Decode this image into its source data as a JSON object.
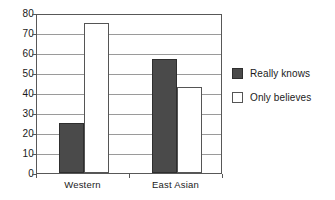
{
  "chart_data": {
    "type": "bar",
    "title": "",
    "subtitle": "",
    "xlabel": "",
    "ylabel": "",
    "categories": [
      "Western",
      "East Asian"
    ],
    "series": [
      {
        "name": "Really knows",
        "values": [
          25,
          57
        ],
        "color": "#4a4a4a",
        "style": "filled"
      },
      {
        "name": "Only believes",
        "values": [
          75,
          43
        ],
        "color": "#ffffff",
        "style": "hollow"
      }
    ],
    "ylim": [
      0,
      80
    ],
    "yticks": [
      0,
      10,
      20,
      30,
      40,
      50,
      60,
      70,
      80
    ],
    "ytick_labels": [
      "0",
      "10",
      "20",
      "30",
      "40",
      "50",
      "60",
      "70",
      "80"
    ],
    "grid": true,
    "grid_axis": "y",
    "legend_position": "right",
    "annotations": []
  },
  "legend": {
    "entries": [
      {
        "label": "Really knows",
        "swatch": "filled-square-dark-gray"
      },
      {
        "label": "Only believes",
        "swatch": "hollow-square-white"
      }
    ]
  },
  "colors": {
    "bar_filled": "#4a4a4a",
    "bar_filled_border": "#2e2e2e",
    "bar_hollow": "#ffffff",
    "bar_hollow_border": "#555555",
    "gridline": "#9a9a9a",
    "axis": "#585858",
    "text": "#1a1a1a",
    "background": "#ffffff"
  }
}
